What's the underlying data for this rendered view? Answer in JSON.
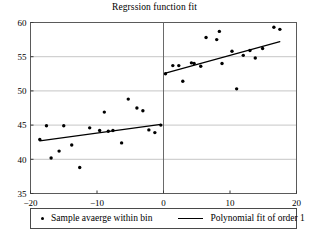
{
  "chart_data": {
    "type": "scatter",
    "title": "Regrssion function fit",
    "xlabel": "",
    "ylabel": "",
    "xlim": [
      -20,
      20
    ],
    "ylim": [
      35,
      60
    ],
    "xticks": [
      -20,
      -10,
      0,
      10,
      20
    ],
    "xtick_labels": [
      "−20",
      "−10",
      "0",
      "10",
      "20"
    ],
    "yticks": [
      35,
      40,
      45,
      50,
      55,
      60
    ],
    "ytick_labels": [
      "35",
      "40",
      "45",
      "50",
      "55",
      "60"
    ],
    "grid": true,
    "grid_axis": "y",
    "cutoff": 0,
    "cutoff_line": true,
    "legend_position": "below",
    "legend": [
      {
        "marker": "dot",
        "label": "Sample avaerge within bin"
      },
      {
        "marker": "line",
        "label": "Polynomial fit of order 1"
      }
    ],
    "series": [
      {
        "name": "Sample avaerge within bin",
        "type": "scatter",
        "marker": "dot",
        "color": "#000000",
        "points": [
          [
            -18.6,
            42.9
          ],
          [
            -17.6,
            44.9
          ],
          [
            -16.9,
            40.2
          ],
          [
            -15.7,
            41.2
          ],
          [
            -15.0,
            44.9
          ],
          [
            -13.8,
            42.1
          ],
          [
            -12.6,
            38.8
          ],
          [
            -11.1,
            44.6
          ],
          [
            -9.6,
            44.2
          ],
          [
            -8.9,
            46.9
          ],
          [
            -8.3,
            44.1
          ],
          [
            -7.6,
            44.2
          ],
          [
            -6.3,
            42.4
          ],
          [
            -5.3,
            48.8
          ],
          [
            -4.0,
            47.5
          ],
          [
            -3.1,
            47.1
          ],
          [
            -2.2,
            44.3
          ],
          [
            -1.3,
            43.9
          ],
          [
            -0.4,
            45.0
          ]
        ]
      },
      {
        "name": "Sample avaerge within bin (right)",
        "type": "scatter",
        "marker": "dot",
        "color": "#000000",
        "points": [
          [
            0.3,
            52.5
          ],
          [
            1.4,
            53.7
          ],
          [
            2.3,
            53.7
          ],
          [
            2.9,
            51.4
          ],
          [
            4.2,
            54.1
          ],
          [
            4.6,
            54.0
          ],
          [
            5.6,
            53.6
          ],
          [
            6.4,
            57.8
          ],
          [
            8.0,
            57.5
          ],
          [
            8.4,
            58.7
          ],
          [
            8.8,
            54.0
          ],
          [
            10.3,
            55.8
          ],
          [
            11.0,
            50.3
          ],
          [
            12.0,
            55.2
          ],
          [
            13.0,
            55.9
          ],
          [
            13.8,
            54.8
          ],
          [
            14.9,
            56.2
          ],
          [
            16.6,
            59.3
          ],
          [
            17.5,
            59.0
          ]
        ]
      },
      {
        "name": "Polynomial fit of order 1 (left)",
        "type": "line",
        "color": "#000000",
        "x_range": [
          -18.6,
          -0.4
        ],
        "y_range": [
          42.7,
          45.1
        ]
      },
      {
        "name": "Polynomial fit of order 1 (right)",
        "type": "line",
        "color": "#000000",
        "x_range": [
          0.3,
          17.5
        ],
        "y_range": [
          52.6,
          57.2
        ]
      }
    ]
  },
  "axes": {
    "frame_color": "#5a5a5a",
    "grid_color": "#b8b8b8",
    "cutoff_color": "#6a6a6a"
  }
}
